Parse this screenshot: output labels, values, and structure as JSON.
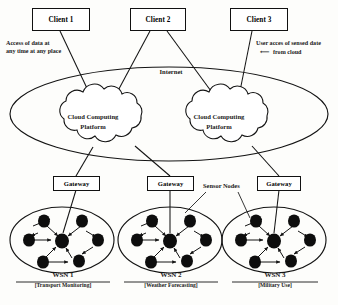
{
  "diagram": {
    "clients": [
      {
        "label": "Client 1"
      },
      {
        "label": "Client 2"
      },
      {
        "label": "Client 3"
      }
    ],
    "annotations": {
      "left": "Access of data at\nany time at any place",
      "left_line1": "Access of data at",
      "left_line2": "any time at any place",
      "right_line1": "User acces of sensed date",
      "right_line2": "from cloud",
      "right_arrow": "⟵"
    },
    "internet": {
      "label": "Internet"
    },
    "clouds": [
      {
        "line1": "Cloud Computing",
        "line2": "Platform"
      },
      {
        "line1": "Cloud Computing",
        "line2": "Platform"
      }
    ],
    "gateways": [
      {
        "label": "Gateway"
      },
      {
        "label": "Gateway"
      },
      {
        "label": "Gateway"
      }
    ],
    "sensor_nodes_label": "Sensor Nodes",
    "networks": [
      {
        "name": "WSN 1",
        "use": "[Transport Monitoring]"
      },
      {
        "name": "WSN 2",
        "use": "[Weather Forecasting]"
      },
      {
        "name": "WSN 3",
        "use": "[Military Use]"
      }
    ],
    "colors": {
      "stroke": "#141414",
      "node_fill": "#0d0d0d",
      "background": "#fdfdfb",
      "text": "#1a1a1a"
    }
  }
}
